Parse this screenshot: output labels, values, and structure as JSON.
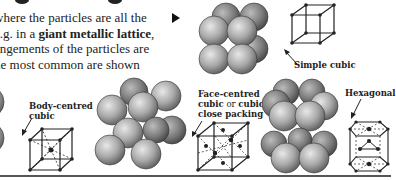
{
  "paragraph": {
    "line1": "where the particles are all the",
    "line2_pre": "e.g. in a ",
    "line2_bold": "giant metallic lattice",
    "line2_post": ",",
    "line3": "angements of the particles are",
    "line4": "he most common are shown"
  },
  "bullet_icon": "triangle-right",
  "structures": [
    {
      "id": "simple-cubic",
      "label": "Simple cubic"
    },
    {
      "id": "body-centred-cubic",
      "label_line1": "Body-centred",
      "label_line2": "cubic"
    },
    {
      "id": "face-centred-cubic",
      "label_line1": "Face-centred",
      "label_line2_a": "cubic",
      "label_line2_b": " or ",
      "label_line2_c": "cubic",
      "label_line3": "close packing"
    },
    {
      "id": "hexagonal",
      "label": "Hexagonal"
    }
  ],
  "colors": {
    "sphere_light": "#d6d6d6",
    "sphere_dark": "#6a6a6a",
    "ink": "#222222",
    "divider": "#555555"
  }
}
